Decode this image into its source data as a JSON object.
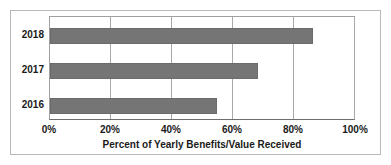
{
  "chart_data": {
    "type": "bar",
    "orientation": "horizontal",
    "title": "",
    "categories": [
      "2018",
      "2017",
      "2016"
    ],
    "values": [
      86.5,
      68.5,
      55
    ],
    "xlabel": "Percent of Yearly Benefits/Value Received",
    "ylabel": "",
    "xlim": [
      0,
      100
    ],
    "xticks": [
      0,
      20,
      40,
      60,
      80,
      100
    ],
    "xticklabels": [
      "0%",
      "20%",
      "40%",
      "60%",
      "80%",
      "100%"
    ],
    "grid": "vertical",
    "legend": "none",
    "bar_color": "#757575",
    "background_color": "#ffffff",
    "border_color": "#b9b9b9",
    "gridline_color": "#a8a8a8",
    "text_color": "#1a1a1a"
  }
}
